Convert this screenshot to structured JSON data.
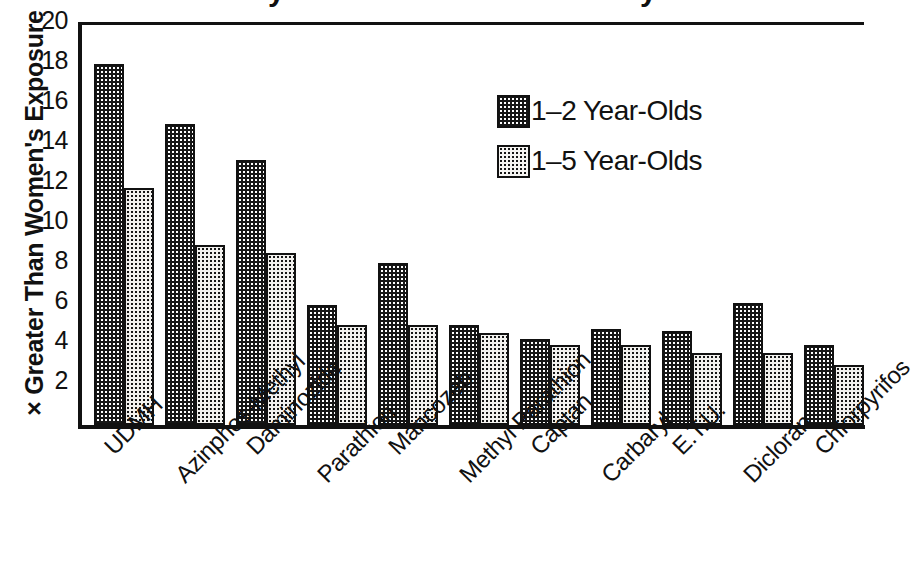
{
  "chart_data": {
    "type": "bar",
    "title": "",
    "xlabel": "",
    "ylabel": "× Greater Than Women's Exposure",
    "ylim": [
      0,
      20
    ],
    "ytick_step": 2,
    "yticks": [
      20,
      18,
      16,
      14,
      12,
      10,
      8,
      6,
      4,
      2
    ],
    "grid": false,
    "legend_position": "upper right",
    "categories": [
      "UDMH",
      "Azinphos-Methyl",
      "Daminozide",
      "Parathion",
      "Mancozeb",
      "Methyl Parathion",
      "Captan",
      "Carbaryl",
      "E.T.U.",
      "Dicloran",
      "Chlorpyrifos"
    ],
    "series": [
      {
        "name": "1–2 Year-Olds",
        "fill": "dark-dotted",
        "values": [
          18.0,
          15.0,
          13.2,
          6.0,
          8.1,
          5.0,
          4.3,
          4.8,
          4.7,
          6.1,
          4.0
        ]
      },
      {
        "name": "1–5 Year-Olds",
        "fill": "light-dotted",
        "values": [
          11.8,
          9.0,
          8.6,
          5.0,
          5.0,
          4.6,
          4.0,
          4.0,
          3.6,
          3.6,
          3.0
        ]
      }
    ]
  },
  "legend": {
    "items": [
      {
        "label": "1–2 Year-Olds",
        "swatch": "dark"
      },
      {
        "label": "1–5 Year-Olds",
        "swatch": "light"
      }
    ]
  },
  "axes": {
    "y_title": "× Greater Than Women's Exposure",
    "y_tick_labels": [
      "20",
      "18",
      "16",
      "14",
      "12",
      "10",
      "8",
      "6",
      "4",
      "2"
    ]
  },
  "colors": {
    "ink": "#111111",
    "paper": "#ffffff",
    "bar_dark": "#161616",
    "bar_light": "#f2f1ee"
  }
}
